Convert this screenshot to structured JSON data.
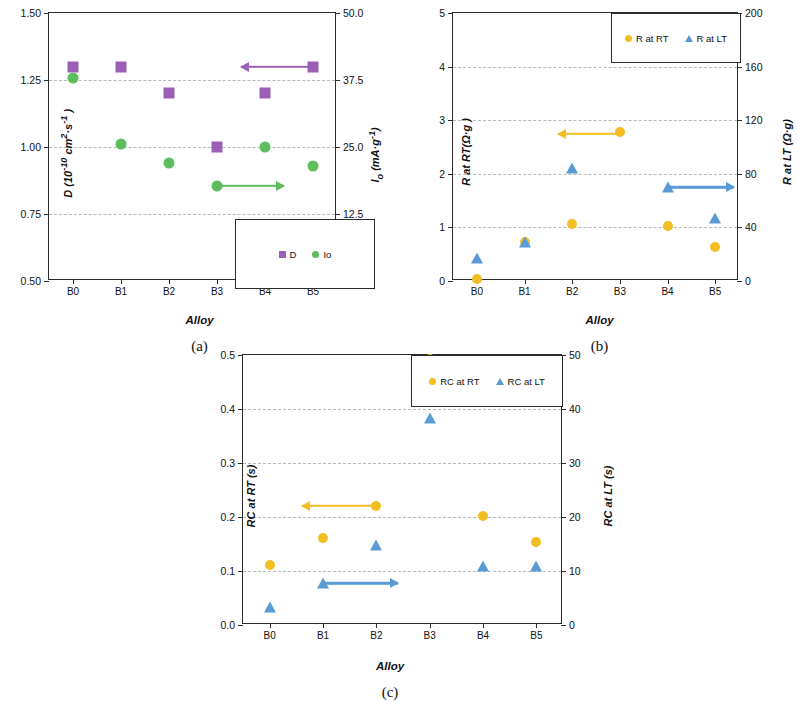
{
  "figure": {
    "panels": [
      "(a)",
      "(b)",
      "(c)"
    ],
    "x_categories": [
      "B0",
      "B1",
      "B2",
      "B3",
      "B4",
      "B5"
    ],
    "xlabel": "Alloy"
  },
  "colors": {
    "purple": "#9B5FB4",
    "green": "#5CBD5C",
    "yellow": "#F2BE22",
    "blue": "#5B9BD5",
    "axis": "#2b2b2b",
    "grid": "#b9b9b9"
  },
  "chart_data": [
    {
      "type": "scatter",
      "panel": "(a)",
      "title": "",
      "xlabel": "Alloy",
      "categories": [
        "B0",
        "B1",
        "B2",
        "B3",
        "B4",
        "B5"
      ],
      "ylabel": "D (10-10 cm2·s-1 )",
      "ylabel_parts": {
        "sym": "D",
        "unit": "(10",
        "exp1": "-10",
        "u2": " cm",
        "exp2": "2",
        "u3": "·s",
        "exp3": "-1",
        "u4": " )"
      },
      "ylim": [
        0.5,
        1.5
      ],
      "yticks": [
        "0.50",
        "0.75",
        "1.00",
        "1.25",
        "1.50"
      ],
      "ytick_values": [
        0.5,
        0.75,
        1.0,
        1.25,
        1.5
      ],
      "y2label": "I0 (mA·g-1)",
      "y2lim": [
        0.0,
        50.0
      ],
      "y2ticks": [
        "0.0",
        "12.5",
        "25.0",
        "37.5",
        "50.0"
      ],
      "y2tick_values": [
        0.0,
        12.5,
        25.0,
        37.5,
        50.0
      ],
      "grid": true,
      "legend_position": "bottom-right",
      "series": [
        {
          "name": "D",
          "marker": "square",
          "color": "#9B5FB4",
          "axis": "left",
          "values": [
            1.3,
            1.3,
            1.2,
            1.0,
            1.2,
            1.3
          ]
        },
        {
          "name": "Io",
          "marker": "circle",
          "color": "#5CBD5C",
          "axis": "right",
          "values": [
            37.8,
            25.6,
            22.1,
            17.8,
            25.0,
            21.5
          ]
        }
      ],
      "annotations": [
        {
          "kind": "arrow",
          "direction": "left",
          "color": "#9B5FB4",
          "from_category": "B5",
          "to_category": "B3.5",
          "y_value": 1.3
        },
        {
          "kind": "arrow",
          "direction": "right",
          "color": "#5CBD5C",
          "from_category": "B3",
          "to_category": "B4.4",
          "y_value": 17.8
        }
      ]
    },
    {
      "type": "scatter",
      "panel": "(b)",
      "title": "",
      "xlabel": "Alloy",
      "categories": [
        "B0",
        "B1",
        "B2",
        "B3",
        "B4",
        "B5"
      ],
      "ylabel": "R at RT(Ω·g )",
      "ylim": [
        0,
        5
      ],
      "yticks": [
        "0",
        "1",
        "2",
        "3",
        "4",
        "5"
      ],
      "ytick_values": [
        0,
        1,
        2,
        3,
        4,
        5
      ],
      "y2label": "R at LT (Ω·g)",
      "y2lim": [
        0,
        200
      ],
      "y2ticks": [
        "0",
        "40",
        "80",
        "120",
        "160",
        "200"
      ],
      "y2tick_values": [
        0,
        40,
        80,
        120,
        160,
        200
      ],
      "grid": true,
      "legend_position": "top-right",
      "series": [
        {
          "name": "R at RT",
          "marker": "circle",
          "color": "#F2BE22",
          "axis": "left",
          "values": [
            0.03,
            0.72,
            1.07,
            2.78,
            1.02,
            0.63
          ]
        },
        {
          "name": "R at LT",
          "marker": "triangle",
          "color": "#5B9BD5",
          "axis": "right",
          "values": [
            17,
            29,
            84,
            171,
            70,
            47
          ]
        }
      ],
      "annotations": [
        {
          "kind": "arrow",
          "direction": "left",
          "color": "#F2BE22",
          "from_category": "B3",
          "to_category": "B1.7",
          "y_value": 2.75
        },
        {
          "kind": "arrow",
          "direction": "right",
          "color": "#5B9BD5",
          "from_category": "B4",
          "to_category": "B5.4",
          "y_value": 70
        }
      ]
    },
    {
      "type": "scatter",
      "panel": "(c)",
      "title": "",
      "xlabel": "Alloy",
      "categories": [
        "B0",
        "B1",
        "B2",
        "B3",
        "B4",
        "B5"
      ],
      "ylabel": "RC at RT (s)",
      "ylim": [
        0.0,
        0.5
      ],
      "yticks": [
        "0.0",
        "0.1",
        "0.2",
        "0.3",
        "0.4",
        "0.5"
      ],
      "ytick_values": [
        0.0,
        0.1,
        0.2,
        0.3,
        0.4,
        0.5
      ],
      "y2label": "RC at LT (s)",
      "y2lim": [
        0,
        50
      ],
      "y2ticks": [
        "0",
        "10",
        "20",
        "30",
        "40",
        "50"
      ],
      "y2tick_values": [
        0,
        10,
        20,
        30,
        40,
        50
      ],
      "grid": true,
      "legend_position": "top-right",
      "series": [
        {
          "name": "RC at RT",
          "marker": "circle",
          "color": "#F2BE22",
          "axis": "left",
          "values": [
            0.111,
            0.162,
            0.221,
            0.492,
            0.201,
            0.153
          ]
        },
        {
          "name": "RC at LT",
          "marker": "triangle",
          "color": "#5B9BD5",
          "axis": "right",
          "values": [
            3.4,
            7.7,
            14.8,
            38.3,
            10.9,
            10.9
          ]
        }
      ],
      "annotations": [
        {
          "kind": "arrow",
          "direction": "left",
          "color": "#F2BE22",
          "from_category": "B2",
          "to_category": "B0.6",
          "y_value": 0.221
        },
        {
          "kind": "arrow",
          "direction": "right",
          "color": "#5B9BD5",
          "from_category": "B1",
          "to_category": "B2.4",
          "y_value": 7.7
        }
      ]
    }
  ]
}
